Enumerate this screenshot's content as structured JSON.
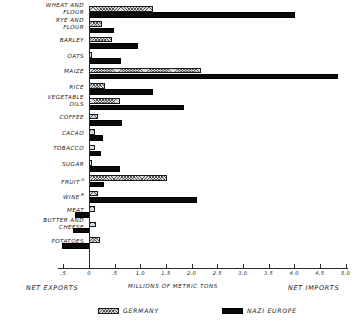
{
  "chart_data": {
    "type": "bar",
    "orientation": "horizontal",
    "title": "",
    "subtitle": "",
    "xlabel": "MILLIONS OF METRIC TONS",
    "ylabel": "",
    "xlim": [
      -0.6,
      5.1
    ],
    "grid": false,
    "legend_position": "bottom",
    "axis_left_caption": "NET EXPORTS",
    "axis_right_caption": "NET IMPORTS",
    "tick_values": [
      -0.5,
      0,
      0.5,
      1.0,
      1.5,
      2.0,
      2.5,
      3.0,
      3.5,
      4.0,
      4.5,
      5.0
    ],
    "tick_labels": [
      ".5",
      "0",
      ".5",
      "1.0",
      "1.5",
      "2.0",
      "2.5",
      "3.0",
      "3.5",
      "4.0",
      "4.5",
      "5.0"
    ],
    "categories": [
      "WHEAT AND FLOUR",
      "RYE AND FLOUR",
      "BARLEY",
      "OATS",
      "MAIZE",
      "RICE",
      "VEGETABLE OILS",
      "COFFEE",
      "CACAO",
      "TOBACCO",
      "SUGAR",
      "FRUIT",
      "WINE",
      "MEAT",
      "BUTTER AND CHEESE",
      "POTATOES"
    ],
    "series": [
      {
        "name": "GERMANY",
        "color": "#d9d9d9",
        "pattern": "hatched",
        "values": [
          1.24,
          0.25,
          0.45,
          0.05,
          2.18,
          0.32,
          0.6,
          0.17,
          0.12,
          0.11,
          0.05,
          1.52,
          0.17,
          0.12,
          0.14,
          0.22
        ]
      },
      {
        "name": "NAZI EUROPE",
        "color": "#0a0a0a",
        "pattern": "solid",
        "values": [
          4.02,
          0.48,
          0.95,
          0.62,
          4.85,
          1.25,
          1.85,
          0.65,
          0.27,
          0.24,
          0.6,
          0.3,
          2.1,
          -0.28,
          -0.32,
          -0.52
        ]
      }
    ]
  },
  "labels": {
    "rows": [
      {
        "line1": "WHEAT AND",
        "line2": "FLOUR",
        "note": ""
      },
      {
        "line1": "RYE AND",
        "line2": "FLOUR",
        "note": ""
      },
      {
        "line1": "BARLEY",
        "line2": "",
        "note": ""
      },
      {
        "line1": "OATS",
        "line2": "",
        "note": ""
      },
      {
        "line1": "MAIZE",
        "line2": "",
        "note": ""
      },
      {
        "line1": "RICE",
        "line2": "",
        "note": ""
      },
      {
        "line1": "VEGETABLE",
        "line2": "OILS",
        "note": ""
      },
      {
        "line1": "COFFEE",
        "line2": "",
        "note": ""
      },
      {
        "line1": "CACAO",
        "line2": "",
        "note": ""
      },
      {
        "line1": "TOBACCO",
        "line2": "",
        "note": ""
      },
      {
        "line1": "SUGAR",
        "line2": "",
        "note": ""
      },
      {
        "line1": "FRUIT",
        "line2": "",
        "note": "a"
      },
      {
        "line1": "WINE",
        "line2": "",
        "note": "b"
      },
      {
        "line1": "MEAT",
        "line2": "",
        "note": ""
      },
      {
        "line1": "BUTTER AND",
        "line2": "CHEESE",
        "note": ""
      },
      {
        "line1": "POTATOES",
        "line2": "",
        "note": ""
      }
    ]
  },
  "legend": {
    "items": [
      {
        "label": "GERMANY",
        "swatch": "hatched-swatch"
      },
      {
        "label": "NAZI EUROPE",
        "swatch": "solid-black-swatch"
      }
    ]
  },
  "captions": {
    "net_exports": "NET EXPORTS",
    "net_imports": "NET IMPORTS",
    "units": "MILLIONS OF METRIC TONS"
  }
}
